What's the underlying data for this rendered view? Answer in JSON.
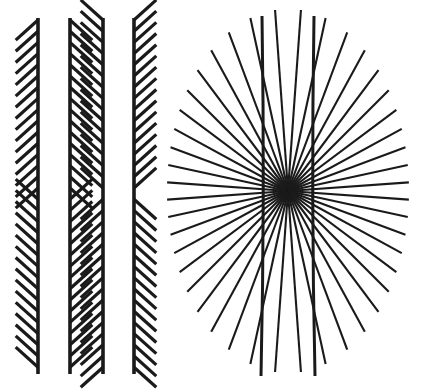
{
  "figure": {
    "kind": "geometric-optical-illusion-plate",
    "background_color": "#ffffff",
    "ink_color": "#1a1a1a",
    "width": 427,
    "height": 392,
    "panels": [
      {
        "name": "zollner-illusion",
        "label": "Zollner illusion",
        "description": "Four long parallel vertical lines with oblique hatch marks; hatch direction reverses at mid-height producing chevrons",
        "vertical_lines": [
          {
            "index": 1,
            "x": 38,
            "y_top": 18,
            "y_bottom": 374,
            "stroke_width": 3.6,
            "hatch_side": "left",
            "hatch_angle_top_deg": 42,
            "hatch_angle_bottom_deg": -42
          },
          {
            "index": 2,
            "x": 70,
            "y_top": 18,
            "y_bottom": 374,
            "stroke_width": 3.6,
            "hatch_side": "right",
            "hatch_angle_top_deg": -42,
            "hatch_angle_bottom_deg": 42
          },
          {
            "index": 3,
            "x": 103,
            "y_top": 18,
            "y_bottom": 374,
            "stroke_width": 3.6,
            "hatch_side": "left",
            "hatch_angle_top_deg": -42,
            "hatch_angle_bottom_deg": 42
          },
          {
            "index": 4,
            "x": 134,
            "y_top": 18,
            "y_bottom": 374,
            "stroke_width": 3.6,
            "hatch_side": "right",
            "hatch_angle_top_deg": 42,
            "hatch_angle_bottom_deg": -42
          }
        ],
        "hatch": {
          "length": 30,
          "spacing": 11.2,
          "stroke_width": 3.2,
          "reversal_y": 196
        }
      },
      {
        "name": "hering-illusion",
        "label": "Hering illusion",
        "description": "Radial fan of straight spokes converging on a central point, crossed by two long near-vertical lines that appear to bow outward",
        "center": {
          "x": 288,
          "y": 191
        },
        "radial": {
          "spoke_count": 44,
          "stroke_width": 2.1,
          "radius_horizontal": 121,
          "radius_vertical": 182
        },
        "vertical_lines": [
          {
            "index": 1,
            "x_top": 262,
            "x_mid": 265,
            "x_bottom": 261,
            "y_top": 16,
            "y_bottom": 376,
            "stroke_width": 3.0
          },
          {
            "index": 2,
            "x_top": 314,
            "x_mid": 311,
            "x_bottom": 315,
            "y_top": 16,
            "y_bottom": 376,
            "stroke_width": 3.0
          }
        ]
      }
    ]
  }
}
